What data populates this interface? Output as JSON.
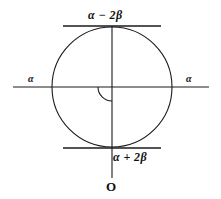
{
  "figure": {
    "kind": "geometry-diagram",
    "stroke_color": "#1a1a1a",
    "background_color": "#ffffff",
    "labels": {
      "top_tangent": "α − 2β",
      "bottom_tangent": "α + 2β",
      "left_axis": "α",
      "right_axis": "α",
      "origin": "O"
    },
    "geometry": {
      "circle": {
        "cx": 112,
        "cy": 87,
        "r": 60
      },
      "horizontal_axis": {
        "x1": 13,
        "x2": 209,
        "y": 87
      },
      "vertical_axis": {
        "x": 112,
        "y1": 26,
        "y2": 178
      },
      "top_tangent": {
        "x1": 63,
        "x2": 161,
        "y": 26
      },
      "bottom_tangent": {
        "x1": 63,
        "x2": 161,
        "y": 148
      },
      "angle_arc": {
        "cx": 112,
        "cy": 87,
        "r": 14,
        "from_deg": 180,
        "to_deg": 270
      }
    }
  }
}
